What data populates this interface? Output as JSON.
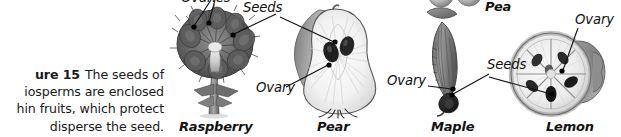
{
  "figure": {
    "caption": {
      "label_clipped": "ure 15",
      "lines": [
        "The seeds of",
        "iosperms are enclosed",
        "hin fruits, which protect",
        "disperse the seed."
      ],
      "full_text": "Figure 15 The seeds of angiosperms are enclosed within fruits, which protect and disperse the seed."
    },
    "panels": [
      {
        "name": "raspberry",
        "label": "Raspberry"
      },
      {
        "name": "pear",
        "label": "Pear"
      },
      {
        "name": "maple",
        "label": "Maple"
      },
      {
        "name": "lemon",
        "label": "Lemon"
      },
      {
        "name": "pea",
        "label": "Pea"
      }
    ],
    "callouts": [
      {
        "name": "raspberry-ovaries",
        "text": "Ovaries"
      },
      {
        "name": "raspberry-seeds",
        "text": "Seeds"
      },
      {
        "name": "pear-ovary",
        "text": "Ovary"
      },
      {
        "name": "maple-ovary",
        "text": "Ovary"
      },
      {
        "name": "maple-seeds",
        "text": "Seeds"
      },
      {
        "name": "lemon-ovary",
        "text": "Ovary"
      }
    ],
    "colors": {
      "text": "#111111",
      "caption_text": "#1a1a1a",
      "leader_line": "#111111",
      "background": "#ffffff",
      "art_dark": "#4a4a4a",
      "art_mid": "#8d8d8d",
      "art_light": "#d6d6d6"
    }
  }
}
